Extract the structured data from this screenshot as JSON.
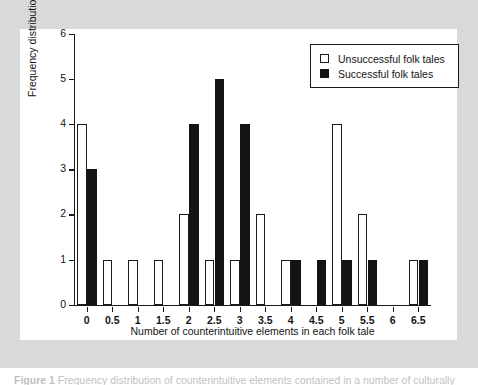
{
  "chart_data": {
    "type": "bar",
    "title": "",
    "xlabel": "Number of counterintuitive elements in each folk tale",
    "ylabel": "Frequency distribution",
    "categories": [
      "0",
      "0.5",
      "1",
      "1.5",
      "2",
      "2.5",
      "3",
      "3.5",
      "4",
      "4.5",
      "5",
      "5.5",
      "6",
      "6.5"
    ],
    "x": [
      0,
      0.5,
      1,
      1.5,
      2,
      2.5,
      3,
      3.5,
      4,
      4.5,
      5,
      5.5,
      6,
      6.5
    ],
    "series": [
      {
        "name": "Unsuccessful folk tales",
        "color": "#ffffff",
        "edge_color": "#1a1a1a",
        "values": [
          4,
          1,
          1,
          1,
          2,
          1,
          1,
          2,
          1,
          0,
          4,
          2,
          0,
          1
        ]
      },
      {
        "name": "Successful folk tales",
        "color": "#141414",
        "edge_color": "#141414",
        "values": [
          3,
          0,
          0,
          0,
          4,
          5,
          4,
          0,
          1,
          1,
          1,
          1,
          0,
          1
        ]
      }
    ],
    "xlim": [
      -0.25,
      6.75
    ],
    "ylim": [
      0,
      6
    ],
    "ytick_labels": [
      "0",
      "1",
      "2",
      "3",
      "4",
      "5",
      "6"
    ],
    "yticks": [
      0,
      1,
      2,
      3,
      4,
      5,
      6
    ],
    "xtick_labels": [
      "0",
      "0.5",
      "1",
      "1.5",
      "2",
      "2.5",
      "3",
      "3.5",
      "4",
      "4.5",
      "5",
      "5.5",
      "6",
      "6.5"
    ],
    "grid": false,
    "legend_position": "top-right"
  },
  "legend": {
    "entries": [
      {
        "label": "Unsuccessful folk tales",
        "swatch": "hollow-square"
      },
      {
        "label": "Successful folk tales",
        "swatch": "filled-square"
      }
    ]
  },
  "caption": {
    "label": "Figure 1",
    "text": "Frequency distribution of counterintuitive elements contained in a number of culturally"
  },
  "colors": {
    "page_background": "#ffffff",
    "figure_mat": "#d9d9d9",
    "chart_background": "#ffffff",
    "ink": "#1a1a1a"
  }
}
